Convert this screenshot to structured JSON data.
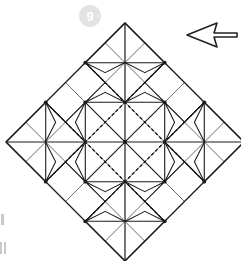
{
  "figure": {
    "step_badge": "9",
    "badge_color": "#e3e3e3",
    "badge_text_color": "#ffffff",
    "arrow": {
      "name": "right-arrow",
      "direction": "right",
      "stroke_color": "#222222",
      "fill_color": "#ffffff"
    }
  },
  "diagram": {
    "shape": "rotated-square-diamond",
    "grid_divisions": 6,
    "line_styles": {
      "grid_color": "#666666",
      "mountain_color": "#1a1a1a",
      "valley_color": "#1a1a1a",
      "valley_dash": "3,2.5",
      "grid_width": 1,
      "mountain_width": 1.1,
      "valley_width": 1.05
    },
    "geometry": {
      "center_x": 125,
      "center_y": 142,
      "half_diagonal": 119,
      "top_vertex": "125,23",
      "left_vertex": "6,142",
      "right_vertex": "244,142",
      "bottom_vertex": "125,261"
    },
    "motifs": {
      "count": 5,
      "name": "four-point-star",
      "positions": [
        "top",
        "left",
        "center",
        "right",
        "bottom"
      ]
    }
  },
  "edge_marks": {
    "label": "cropped-page-marks",
    "color": "#c9c9c9"
  }
}
